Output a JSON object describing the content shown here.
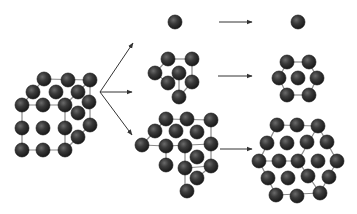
{
  "diagram": {
    "type": "atomic-cluster-structures",
    "colors": {
      "background": "#ffffff",
      "atom_dark": "#1a1a1a",
      "atom_mid": "#3a3a3a",
      "atom_highlight": "#6a6a6a",
      "bond_line": "#8a8a8a",
      "arrow": "#333333"
    },
    "atom_radius": 7,
    "cube": {
      "label": "fcc-crystal-cube",
      "edges": [
        [
          22,
          105,
          65,
          105
        ],
        [
          65,
          105,
          65,
          150
        ],
        [
          65,
          150,
          22,
          150
        ],
        [
          22,
          150,
          22,
          105
        ],
        [
          22,
          105,
          44,
          79
        ],
        [
          44,
          79,
          90,
          80
        ],
        [
          90,
          80,
          65,
          105
        ],
        [
          90,
          80,
          90,
          125
        ],
        [
          90,
          125,
          65,
          150
        ]
      ],
      "atoms": [
        [
          44,
          79
        ],
        [
          68,
          80
        ],
        [
          90,
          80
        ],
        [
          33,
          92
        ],
        [
          56,
          92
        ],
        [
          78,
          92
        ],
        [
          89,
          102
        ],
        [
          22,
          105
        ],
        [
          43,
          105
        ],
        [
          65,
          105
        ],
        [
          78,
          113
        ],
        [
          90,
          125
        ],
        [
          22,
          128
        ],
        [
          43,
          128
        ],
        [
          65,
          128
        ],
        [
          78,
          137
        ],
        [
          22,
          150
        ],
        [
          43,
          150
        ],
        [
          65,
          150
        ]
      ]
    },
    "branch_arrows": {
      "origin": [
        100,
        92
      ],
      "tips": [
        [
          133,
          43
        ],
        [
          132,
          92
        ],
        [
          132,
          135
        ]
      ]
    },
    "rows": [
      {
        "name": "single-atom",
        "left": {
          "edges": [],
          "atoms": [
            [
              175,
              22
            ]
          ]
        },
        "arrow": [
          219,
          22,
          252,
          22
        ],
        "right": {
          "edges": [],
          "atoms": [
            [
              298,
              22
            ]
          ]
        }
      },
      {
        "name": "seven-atom-cluster",
        "left": {
          "edges": [
            [
              168,
              59,
              192,
              59
            ],
            [
              168,
              59,
              155,
              73
            ],
            [
              155,
              73,
              168,
              83
            ],
            [
              192,
              59,
              192,
              82
            ],
            [
              179,
              73,
              179,
              97
            ],
            [
              168,
              83,
              179,
              73
            ],
            [
              192,
              82,
              179,
              97
            ]
          ],
          "atoms": [
            [
              168,
              59
            ],
            [
              192,
              59
            ],
            [
              155,
              73
            ],
            [
              179,
              73
            ],
            [
              168,
              83
            ],
            [
              192,
              82
            ],
            [
              179,
              97
            ]
          ]
        },
        "arrow": [
          218,
          76,
          252,
          76
        ],
        "right": {
          "edges": [
            [
              287,
              62,
              309,
              62
            ],
            [
              309,
              62,
              317,
              78
            ],
            [
              317,
              78,
              309,
              95
            ],
            [
              309,
              95,
              287,
              95
            ],
            [
              287,
              95,
              279,
              78
            ],
            [
              279,
              78,
              287,
              62
            ]
          ],
          "atoms": [
            [
              287,
              62
            ],
            [
              309,
              62
            ],
            [
              279,
              78
            ],
            [
              298,
              78
            ],
            [
              317,
              78
            ],
            [
              287,
              95
            ],
            [
              309,
              95
            ]
          ]
        }
      },
      {
        "name": "nineteen-atom-cluster",
        "left": {
          "edges": [
            [
              166,
              119,
              211,
              120
            ],
            [
              211,
              120,
              211,
              166
            ],
            [
              142,
              145,
              166,
              146
            ],
            [
              166,
              146,
              211,
              144
            ],
            [
              166,
              119,
              155,
              131
            ],
            [
              155,
              131,
              142,
              145
            ],
            [
              166,
              146,
              166,
              165
            ],
            [
              185,
              146,
              185,
              168
            ],
            [
              185,
              168,
              211,
              166
            ],
            [
              185,
              168,
              185,
              191
            ],
            [
              211,
              166,
              197,
              178
            ]
          ],
          "atoms": [
            [
              166,
              119
            ],
            [
              187,
              119
            ],
            [
              211,
              120
            ],
            [
              155,
              131
            ],
            [
              176,
              131
            ],
            [
              197,
              132
            ],
            [
              142,
              145
            ],
            [
              166,
              146
            ],
            [
              185,
              146
            ],
            [
              211,
              144
            ],
            [
              197,
              157
            ],
            [
              166,
              165
            ],
            [
              185,
              168
            ],
            [
              211,
              166
            ],
            [
              197,
              178
            ],
            [
              187,
              191
            ]
          ]
        },
        "arrow": [
          220,
          149,
          252,
          149
        ],
        "right": {
          "edges": [
            [
              277,
              125,
              318,
              126
            ],
            [
              318,
              126,
              337,
              161
            ],
            [
              337,
              161,
              320,
              193
            ],
            [
              320,
              193,
              276,
              195
            ],
            [
              276,
              195,
              259,
              161
            ],
            [
              259,
              161,
              277,
              125
            ],
            [
              259,
              161,
              298,
              161
            ],
            [
              298,
              161,
              318,
              126
            ],
            [
              298,
              161,
              320,
              193
            ]
          ],
          "atoms": [
            [
              277,
              125
            ],
            [
              297,
              125
            ],
            [
              318,
              126
            ],
            [
              267,
              143
            ],
            [
              287,
              143
            ],
            [
              307,
              142
            ],
            [
              327,
              142
            ],
            [
              259,
              161
            ],
            [
              279,
              161
            ],
            [
              298,
              161
            ],
            [
              318,
              161
            ],
            [
              337,
              161
            ],
            [
              268,
              178
            ],
            [
              288,
              178
            ],
            [
              308,
              176
            ],
            [
              329,
              177
            ],
            [
              276,
              195
            ],
            [
              297,
              196
            ],
            [
              320,
              193
            ]
          ]
        }
      }
    ]
  }
}
